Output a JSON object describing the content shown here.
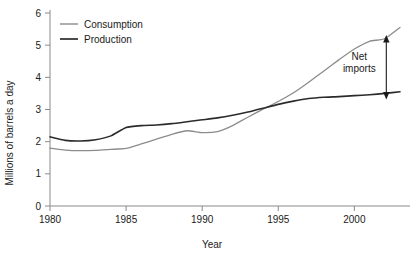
{
  "chart_data": {
    "type": "line",
    "title": "",
    "xlabel": "Year",
    "ylabel": "Millions of barrels a day",
    "xlim": [
      1980,
      2003
    ],
    "ylim": [
      0,
      6
    ],
    "xticks": [
      1980,
      1985,
      1990,
      1995,
      2000
    ],
    "xtick_labels": [
      "1980",
      "1985",
      "1990",
      "1995",
      "2000"
    ],
    "yticks": [
      0,
      1,
      2,
      3,
      4,
      5,
      6
    ],
    "ytick_labels": [
      "0",
      "1",
      "2",
      "3",
      "4",
      "5",
      "6"
    ],
    "grid": false,
    "legend_position": "top-left",
    "x": [
      1980,
      1981,
      1982,
      1983,
      1984,
      1985,
      1986,
      1987,
      1988,
      1989,
      1990,
      1991,
      1992,
      1993,
      1994,
      1995,
      1996,
      1997,
      1998,
      1999,
      2000,
      2001,
      2002,
      2003
    ],
    "series": [
      {
        "name": "Consumption",
        "color": "#8c8c8c",
        "values": [
          1.8,
          1.74,
          1.72,
          1.73,
          1.76,
          1.79,
          1.93,
          2.08,
          2.23,
          2.34,
          2.28,
          2.31,
          2.5,
          2.76,
          3.01,
          3.25,
          3.52,
          3.85,
          4.2,
          4.55,
          4.88,
          5.12,
          5.2,
          5.55
        ]
      },
      {
        "name": "Production",
        "color": "#2b2b2b",
        "values": [
          2.15,
          2.04,
          2.02,
          2.06,
          2.18,
          2.44,
          2.5,
          2.52,
          2.56,
          2.62,
          2.68,
          2.74,
          2.82,
          2.92,
          3.04,
          3.16,
          3.26,
          3.34,
          3.38,
          3.4,
          3.43,
          3.46,
          3.5,
          3.55
        ]
      }
    ],
    "annotations": [
      {
        "name": "net-imports",
        "text_line_1": "Net",
        "text_line_2": "imports",
        "arrow_x": 2002.1,
        "arrow_y_top": 5.18,
        "arrow_y_bottom": 3.45
      }
    ]
  },
  "legend": {
    "items": [
      {
        "label": "Consumption",
        "color": "#8c8c8c"
      },
      {
        "label": "Production",
        "color": "#2b2b2b"
      }
    ]
  }
}
